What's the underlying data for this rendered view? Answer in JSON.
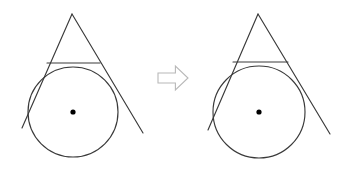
{
  "figure": {
    "background_color": "#ffffff",
    "stroke_color": "#3a3a3a",
    "dot_color": "#000000",
    "arrow_stroke_color": "#b8b8b8",
    "arrow_fill_color": "#ffffff",
    "width": 344,
    "height": 174
  },
  "left_figure": {
    "name": "before-diagram",
    "circle": {
      "label": "circle",
      "cx": 73,
      "cy": 112,
      "r": 45
    },
    "center_dot": {
      "label": "circle-center-point",
      "cx": 73,
      "cy": 112,
      "r": 2.6
    },
    "triangle": {
      "label": "tangent-triangle",
      "apex_x": 72,
      "apex_y": 14,
      "base_y": 63,
      "base_left_x": 47,
      "base_right_x": 100
    },
    "left_tangent": {
      "label": "left-tangent-line",
      "x1": 72,
      "y1": 14,
      "x2": 22,
      "y2": 128
    },
    "right_tangent": {
      "label": "right-tangent-line",
      "x1": 72,
      "y1": 14,
      "x2": 143,
      "y2": 133
    }
  },
  "arrow": {
    "name": "transformation-arrow",
    "direction": "right",
    "x": 158,
    "y": 66,
    "width": 30,
    "height": 24
  },
  "right_figure": {
    "name": "after-diagram",
    "circle": {
      "label": "circle",
      "cx": 259,
      "cy": 112,
      "r": 46
    },
    "center_dot": {
      "label": "circle-center-point",
      "cx": 259,
      "cy": 112,
      "r": 2.6
    },
    "triangle": {
      "label": "tangent-triangle",
      "apex_x": 258,
      "apex_y": 14,
      "base_y": 62,
      "base_left_x": 233,
      "base_right_x": 288
    },
    "left_tangent": {
      "label": "left-tangent-line",
      "x1": 258,
      "y1": 14,
      "x2": 208,
      "y2": 130
    },
    "right_tangent": {
      "label": "right-tangent-line",
      "x1": 258,
      "y1": 14,
      "x2": 330,
      "y2": 134
    }
  }
}
